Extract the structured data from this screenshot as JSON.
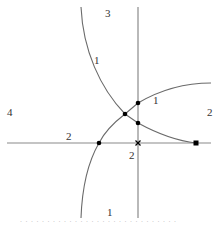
{
  "diagram": {
    "region_labels": {
      "top": "3",
      "left": "4",
      "right": "2",
      "bottom": "1"
    },
    "curve_labels": {
      "left_curve_upper": "1",
      "right_curve_upper": "1",
      "horizontal_left": "2",
      "vertical_bottom": "2"
    },
    "colors": {
      "axis": "#8a8a8a",
      "curve": "#6a6a6a",
      "point": "#000000",
      "text": "#333333"
    },
    "points": [
      {
        "type": "dot",
        "x": 125,
        "y": 114
      },
      {
        "type": "dot",
        "x": 138,
        "y": 103
      },
      {
        "type": "dot",
        "x": 138,
        "y": 123
      },
      {
        "type": "dot",
        "x": 99,
        "y": 143
      },
      {
        "type": "square",
        "x": 196,
        "y": 143
      },
      {
        "type": "cross",
        "x": 138,
        "y": 143
      }
    ]
  },
  "caption": "· · · · · · · · · ·  · · · · · · · · · ·  · · · · · · · · ·"
}
